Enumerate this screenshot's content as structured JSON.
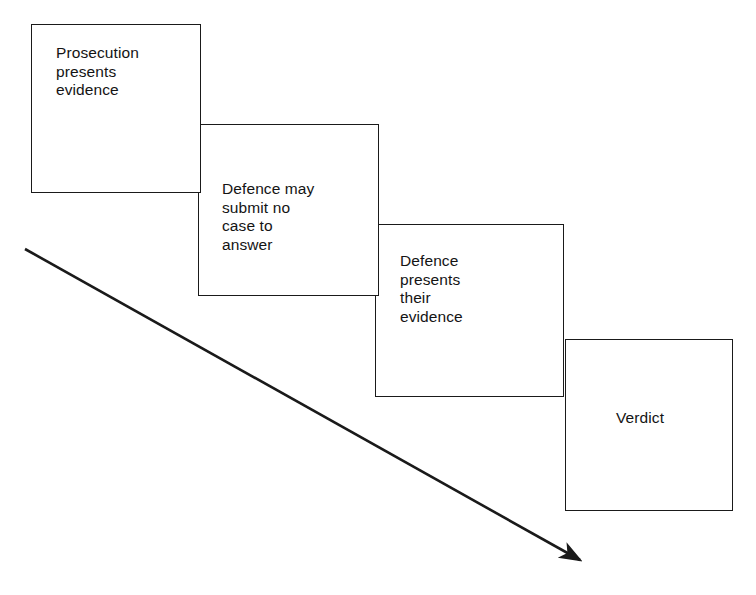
{
  "diagram": {
    "type": "flow-sequence",
    "orientation": "descending-staircase",
    "colors": {
      "box_fill": "#ffffff",
      "box_stroke": "#1a1a1a",
      "text": "#141414",
      "arrow": "#1a1a1a",
      "background": "#ffffff"
    },
    "stages": [
      {
        "id": "stage-1",
        "order": 1,
        "label": "Prosecution\npresents\nevidence",
        "lines": [
          "Prosecution",
          "presents",
          "evidence"
        ]
      },
      {
        "id": "stage-2",
        "order": 2,
        "label": "Defence may\nsubmit no\ncase to\nanswer",
        "lines": [
          "Defence may",
          "submit no",
          "case to",
          "answer"
        ]
      },
      {
        "id": "stage-3",
        "order": 3,
        "label": "Defence\npresents\ntheir\nevidence",
        "lines": [
          "Defence",
          "presents",
          "their",
          "evidence"
        ]
      },
      {
        "id": "stage-4",
        "order": 4,
        "label": "Verdict",
        "lines": [
          "Verdict"
        ]
      }
    ],
    "arrow": {
      "name": "time-progression-arrow",
      "from": [
        25,
        249
      ],
      "to": [
        592,
        567
      ],
      "head": "solid-triangle",
      "label": ""
    }
  }
}
